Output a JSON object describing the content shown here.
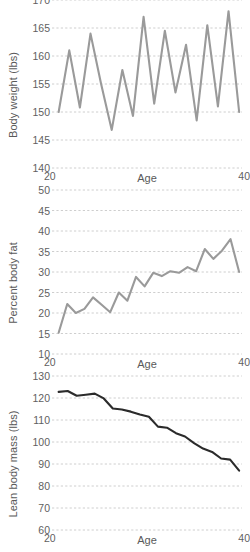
{
  "figure": {
    "background_color": "#ffffff",
    "grid_color": "#c8c8c8",
    "tick_color": "#5f5f5f"
  },
  "chart_data": [
    {
      "type": "line",
      "title": "",
      "xlabel": "Age",
      "ylabel": "Body weight (lbs)",
      "xlim": [
        20,
        40
      ],
      "ylim": [
        140,
        170
      ],
      "xticks": [
        20,
        40
      ],
      "yticks": [
        140,
        145,
        150,
        155,
        160,
        165,
        170
      ],
      "grid": true,
      "legend": "none",
      "line_color": "#9a9a9a",
      "x": [
        20.6,
        21.5,
        22.4,
        23.3,
        24.2,
        25.1,
        26.0,
        26.9,
        27.8,
        28.7,
        29.6,
        30.5,
        31.4,
        32.3,
        33.2,
        34.1,
        35.0,
        35.9,
        36.8,
        37.7,
        38.6,
        39.5
      ],
      "values": [
        150.0,
        161.0,
        150.8,
        164.0,
        155.0,
        146.8,
        157.5,
        149.3,
        167.0,
        151.5,
        164.5,
        153.5,
        162.0,
        148.5,
        165.5,
        151.0,
        168.0,
        150.0
      ],
      "series": [
        {
          "name": "Body weight",
          "values": [
            150.0,
            161.0,
            150.8,
            164.0,
            155.0,
            146.8,
            157.5,
            149.3,
            167.0,
            151.5,
            164.5,
            153.5,
            162.0,
            148.5,
            165.5,
            151.0,
            168.0,
            150.0
          ]
        }
      ]
    },
    {
      "type": "line",
      "title": "",
      "xlabel": "Age",
      "ylabel": "Percent body fat",
      "xlim": [
        20,
        40
      ],
      "ylim": [
        10,
        50
      ],
      "xticks": [
        20,
        40
      ],
      "yticks": [
        10,
        15,
        20,
        25,
        30,
        35,
        40,
        45,
        50
      ],
      "grid": true,
      "legend": "none",
      "line_color": "#9a9a9a",
      "x": [
        20.6,
        21.5,
        22.3,
        23.1,
        23.9,
        24.7,
        25.5,
        26.3,
        27.1,
        27.9,
        28.7,
        29.5,
        30.3,
        31.1,
        31.9,
        32.7,
        33.5,
        34.3,
        35.1,
        35.9,
        36.7,
        37.5,
        38.3,
        39.4
      ],
      "values": [
        15.2,
        22.2,
        20.0,
        21.0,
        23.8,
        22.0,
        20.2,
        25.0,
        23.0,
        28.8,
        26.5,
        29.8,
        29.0,
        30.2,
        29.8,
        31.2,
        30.2,
        35.6,
        33.2,
        35.2,
        38.0,
        30.0
      ],
      "series": [
        {
          "name": "Percent body fat",
          "values": [
            15.2,
            22.2,
            20.0,
            21.0,
            23.8,
            22.0,
            20.2,
            25.0,
            23.0,
            28.8,
            26.5,
            29.8,
            29.0,
            30.2,
            29.8,
            31.2,
            30.2,
            35.6,
            33.2,
            35.2,
            38.0,
            30.0
          ]
        }
      ]
    },
    {
      "type": "line",
      "title": "",
      "xlabel": "Age",
      "ylabel": "Lean body mass (lbs)",
      "xlim": [
        20,
        40
      ],
      "ylim": [
        60,
        130
      ],
      "xticks": [
        20,
        40
      ],
      "yticks": [
        60,
        70,
        80,
        90,
        100,
        110,
        120,
        130
      ],
      "grid": true,
      "legend": "none",
      "line_color": "#2b2b2b",
      "x": [
        20.5,
        21.4,
        22.3,
        23.2,
        24.1,
        25.0,
        25.9,
        26.8,
        27.7,
        28.6,
        29.5,
        30.4,
        31.3,
        32.2,
        33.1,
        34.0,
        34.9,
        35.8,
        36.7,
        37.6,
        38.5,
        39.4
      ],
      "values": [
        122.8,
        123.2,
        121.0,
        121.5,
        122.0,
        119.8,
        115.2,
        114.8,
        113.8,
        112.5,
        111.5,
        107.0,
        106.5,
        104.0,
        102.5,
        99.5,
        97.0,
        95.5,
        92.5,
        92.0,
        87.0
      ],
      "series": [
        {
          "name": "Lean body mass",
          "values": [
            122.8,
            123.2,
            121.0,
            121.5,
            122.0,
            119.8,
            115.2,
            114.8,
            113.8,
            112.5,
            111.5,
            107.0,
            106.5,
            104.0,
            102.5,
            99.5,
            97.0,
            95.5,
            92.5,
            92.0,
            87.0
          ]
        }
      ]
    }
  ]
}
